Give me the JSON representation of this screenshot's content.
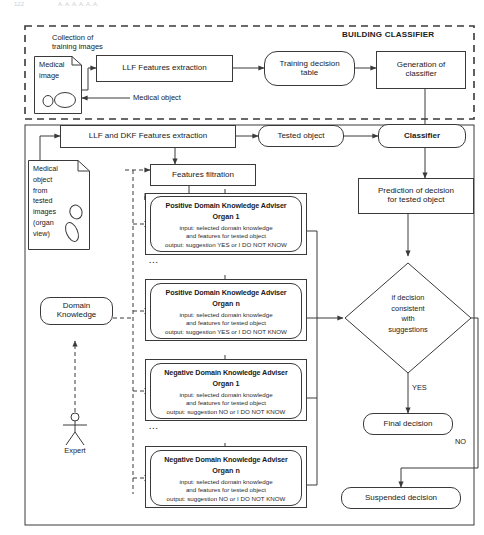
{
  "page_header": {
    "left": "122",
    "right": "A. A. A. A. A. A."
  },
  "sections": {
    "building_classifier": "BUILDING CLASSIFIER"
  },
  "labels": {
    "collection_of_training_images": "Collection of\ntraining images",
    "medical_object_callout": "Medical object",
    "expert": "Expert",
    "ellipsis": "...",
    "yes": "YES",
    "no": "NO"
  },
  "nodes": {
    "medical_image_doc": "Medical\nimage",
    "llf_features_extraction": "LLF Features extraction",
    "training_decision_table": "Training decision\ntable",
    "generation_of_classifier": "Generation of\nclassifier",
    "llf_dkf_features_extraction": "LLF and DKF Features extraction",
    "tested_object": "Tested object",
    "classifier": "Classifier",
    "features_filtration": "Features filtration",
    "medical_object_doc": "Medical\nobject\nfrom\ntested\nimages\n(organ\nview)",
    "domain_knowledge": "Domain\nKnowledge",
    "prediction_of_decision": "Prediction of decision\nfor tested object",
    "decision_diamond": "if decision\nconsistent\nwith\nsuggestions",
    "final_decision": "Final decision",
    "suspended_decision": "Suspended decision"
  },
  "advisers": [
    {
      "id": "positive-organ-1",
      "title": "Positive Domain Knowledge Adviser",
      "organ": "Organ 1",
      "input_line1": "input: selected domain knowledge",
      "input_line2": "and features for tested object",
      "output_line": "output: suggestion YES or I DO NOT KNOW"
    },
    {
      "id": "positive-organ-n",
      "title": "Positive Domain Knowledge Adviser",
      "organ": "Organ n",
      "input_line1": "input: selected domain knowledge",
      "input_line2": "and features for tested object",
      "output_line": "output: suggestion YES or I DO NOT KNOW"
    },
    {
      "id": "negative-organ-1",
      "title": "Negative Domain Knowledge Adviser",
      "organ": "Organ 1",
      "input_line1": "input: selected domain knowledge",
      "input_line2": "and features for tested object",
      "output_line": "output: suggestion NO or I DO NOT KNOW"
    },
    {
      "id": "negative-organ-n",
      "title": "Negative Domain Knowledge Adviser",
      "organ": "Organ n",
      "input_line1": "input: selected domain knowledge",
      "input_line2": "and features for tested object",
      "output_line": "output: suggestion NO or I DO NOT KNOW"
    }
  ],
  "colors": {
    "stroke": "#3a3a3a",
    "background": "#ffffff",
    "text": "#1a1a1a"
  }
}
